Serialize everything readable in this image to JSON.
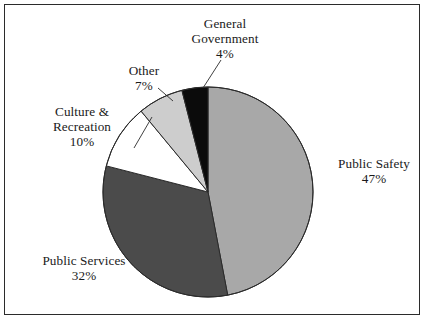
{
  "figure": {
    "background_color": "#ffffff",
    "frame_color": "#2b2b2b",
    "has_frame": true
  },
  "chart_data": {
    "type": "pie",
    "title": "",
    "subtitle": "",
    "xlabel": "",
    "ylabel": "",
    "legend_position": "none",
    "labels_outside": true,
    "grid": false,
    "start_angle_deg": 0,
    "direction": "clockwise",
    "total_percent": 100,
    "categories": [
      "Public Safety",
      "Public Services",
      "Culture & Recreation",
      "Other",
      "General Government"
    ],
    "values": [
      47,
      32,
      10,
      7,
      4
    ],
    "value_labels": [
      "47%",
      "32%",
      "10%",
      "7%",
      "4%"
    ],
    "slices": [
      {
        "label": "Public Safety",
        "label_line1": "Public Safety",
        "label_line2": "47%",
        "value": 47,
        "percent_text": "47%",
        "color": "#a8a8a8",
        "start_deg": 0,
        "end_deg": 169.2,
        "leader_line": false
      },
      {
        "label": "Public Services",
        "label_line1": "Public Services",
        "label_line2": "32%",
        "value": 32,
        "percent_text": "32%",
        "color": "#4b4b4b",
        "start_deg": 169.2,
        "end_deg": 284.4,
        "leader_line": false
      },
      {
        "label": "Culture & Recreation",
        "label_line1": "Culture &",
        "label_line2": "Recreation",
        "label_line3": "10%",
        "value": 10,
        "percent_text": "10%",
        "color": "#ffffff",
        "start_deg": 284.4,
        "end_deg": 320.4,
        "leader_line": true
      },
      {
        "label": "Other",
        "label_line1": "Other",
        "label_line2": "7%",
        "value": 7,
        "percent_text": "7%",
        "color": "#cdcdcd",
        "start_deg": 320.4,
        "end_deg": 345.6,
        "leader_line": true
      },
      {
        "label": "General Government",
        "label_line1": "General",
        "label_line2": "Government",
        "label_line3": "4%",
        "value": 4,
        "percent_text": "4%",
        "color": "#0b0b0b",
        "start_deg": 345.6,
        "end_deg": 360,
        "leader_line": true
      }
    ],
    "geometry": {
      "center_x": 208,
      "center_y": 192,
      "radius": 105,
      "outline_color": "#2b2b2b"
    }
  }
}
